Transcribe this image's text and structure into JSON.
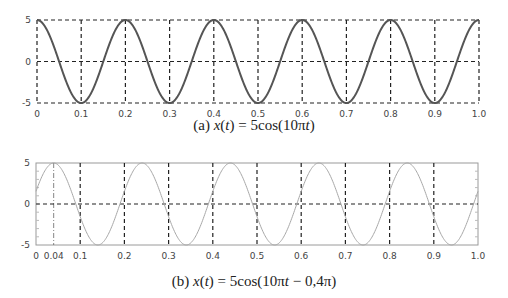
{
  "chart_data": [
    {
      "type": "line",
      "title": "(a) x(t) = 5cos(10πt)",
      "caption": "(a) x(t) = 5cos(10πt)",
      "function": {
        "amplitude": 5,
        "omega_pi": 10,
        "phase_pi": 0
      },
      "xlabel": "",
      "ylabel": "",
      "xlim": [
        0,
        1.0
      ],
      "ylim": [
        -5,
        5
      ],
      "x_ticks": [
        "0",
        "0.1",
        "0.2",
        "0.3",
        "0.4",
        "0.5",
        "0.6",
        "0.7",
        "0.8",
        "0.9",
        "1.0"
      ],
      "y_ticks": [
        "5",
        "0",
        "-5"
      ],
      "grid": "dashed",
      "line_color": "#555555",
      "line_width": 2,
      "samples": {
        "x": [
          0,
          0.1,
          0.2,
          0.3,
          0.4,
          0.5,
          0.6,
          0.7,
          0.8,
          0.9,
          1.0
        ],
        "y": [
          5,
          -5,
          5,
          -5,
          5,
          -5,
          5,
          -5,
          5,
          -5,
          5
        ]
      },
      "frame": {
        "left": 37,
        "right": 479,
        "top": 20,
        "bottom": 103
      }
    },
    {
      "type": "line",
      "title": "(b) x(t) = 5cos(10πt − 0,4π)",
      "caption": "(b) x(t) = 5cos(10πt − 0,4π)",
      "function": {
        "amplitude": 5,
        "omega_pi": 10,
        "phase_pi": -0.4
      },
      "xlabel": "",
      "ylabel": "",
      "xlim": [
        0,
        1.0
      ],
      "ylim": [
        -5,
        5
      ],
      "x_ticks": [
        "0",
        "0.04",
        "0.1",
        "0.2",
        "0.3",
        "0.4",
        "0.5",
        "0.6",
        "0.7",
        "0.8",
        "0.9",
        "1.0"
      ],
      "y_ticks": [
        "5",
        "0",
        "-5"
      ],
      "grid": "dashed",
      "annotation": "peak at t = 0.04",
      "line_color": "#a8a8a8",
      "line_width": 1,
      "samples": {
        "x": [
          0,
          0.04,
          0.09,
          0.14,
          0.19,
          0.24,
          0.34,
          0.44,
          0.54,
          0.64,
          0.74,
          0.84,
          0.94,
          1.0
        ],
        "y": [
          1.55,
          5,
          0,
          -5,
          0,
          5,
          -5,
          5,
          -5,
          5,
          -5,
          5,
          -5,
          1.55
        ]
      },
      "frame": {
        "left": 36,
        "right": 478,
        "top": 163,
        "bottom": 245
      }
    }
  ],
  "captions": {
    "a_prefix": "(a) ",
    "a_var": "x",
    "a_paren_open": "(",
    "a_t": "t",
    "a_paren_close": ")",
    "a_rhs": " = 5cos(10π",
    "a_t2": "t",
    "a_end": ")",
    "b_prefix": "(b) ",
    "b_var": "x",
    "b_paren_open": "(",
    "b_t": "t",
    "b_paren_close": ")",
    "b_rhs": " = 5cos(10π",
    "b_t2": "t",
    "b_end": " − 0,4π)"
  }
}
